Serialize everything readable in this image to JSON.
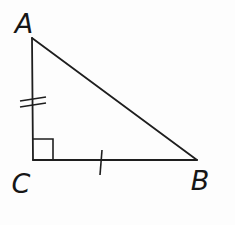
{
  "figure": {
    "type": "right-triangle-diagram",
    "vertex_labels": {
      "top": "A",
      "bottom_left": "C",
      "bottom_right": "B"
    },
    "right_angle_at": "C",
    "marks": {
      "side_AC": "double-tick",
      "side_CB": "single-tick"
    }
  },
  "colors": {
    "background": "#fdfdfd",
    "line": "#1e1e1e",
    "label": "#161616"
  }
}
